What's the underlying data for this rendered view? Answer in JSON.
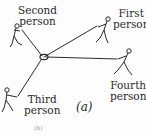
{
  "diagram": {
    "caption": "(a)",
    "center": {
      "x": 43,
      "y": 57
    },
    "people": [
      {
        "id": "first",
        "label_line1": "First",
        "label_line2": "person"
      },
      {
        "id": "second",
        "label_line1": "Second",
        "label_line2": "person"
      },
      {
        "id": "third",
        "label_line1": "Third",
        "label_line2": "person"
      },
      {
        "id": "fourth",
        "label_line1": "Fourth",
        "label_line2": "person"
      }
    ],
    "faint_text": "(b)",
    "colors": {
      "ink": "#2a2a2a",
      "background": "#fdfdfd"
    }
  }
}
